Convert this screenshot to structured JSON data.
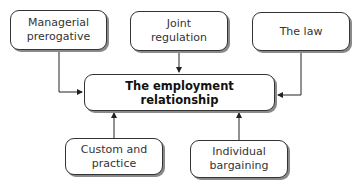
{
  "diagram": {
    "center": {
      "label": "The employment relationship"
    },
    "inputs": [
      {
        "id": "managerial",
        "label": "Managerial prerogative",
        "position": "top-left"
      },
      {
        "id": "joint",
        "label": "Joint regulation",
        "position": "top-center"
      },
      {
        "id": "law",
        "label": "The law",
        "position": "top-right"
      },
      {
        "id": "custom",
        "label": "Custom and practice",
        "position": "bottom-left"
      },
      {
        "id": "individual",
        "label": "Individual bargaining",
        "position": "bottom-right"
      }
    ],
    "edges": [
      {
        "from": "managerial",
        "to": "center"
      },
      {
        "from": "joint",
        "to": "center"
      },
      {
        "from": "law",
        "to": "center"
      },
      {
        "from": "custom",
        "to": "center"
      },
      {
        "from": "individual",
        "to": "center"
      }
    ],
    "colors": {
      "line": "#222222",
      "border": "#333333",
      "shadow": "#8a8a8a",
      "background": "#ffffff"
    }
  }
}
